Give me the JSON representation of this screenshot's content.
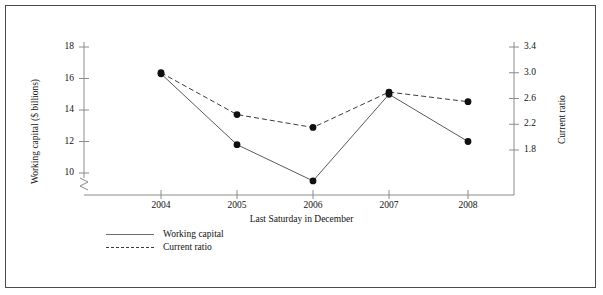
{
  "chart_data": {
    "type": "line",
    "title": "",
    "xlabel": "Last Saturday in December",
    "ylabel": "Working capital ($ billions)",
    "y2label": "Current ratio",
    "categories": [
      "2004",
      "2005",
      "2006",
      "2007",
      "2008"
    ],
    "x": [
      2004,
      2005,
      2006,
      2007,
      2008
    ],
    "ylim": [
      9.2,
      18
    ],
    "y2lim": [
      1.62,
      3.4
    ],
    "yticks": [
      "18",
      "16",
      "14",
      "12",
      "10"
    ],
    "ytick_values": [
      18,
      16,
      14,
      12,
      10
    ],
    "y2ticks": [
      "3.4",
      "3.0",
      "2.6",
      "2.2",
      "1.8"
    ],
    "y2tick_values": [
      3.4,
      3.0,
      2.6,
      2.2,
      1.8
    ],
    "xticks": [
      "2004",
      "2005",
      "2006",
      "2007",
      "2008"
    ],
    "axis_break": true,
    "grid": false,
    "legend_position": "below-left",
    "series": [
      {
        "name": "Working capital",
        "axis": "left",
        "style": "solid",
        "color": "#5a5a5a",
        "marker": "filled-circle",
        "values": [
          16.3,
          11.8,
          9.5,
          15.0,
          12.0
        ]
      },
      {
        "name": "Current ratio",
        "axis": "right",
        "style": "dashed",
        "color": "#3a3a3a",
        "marker": "filled-circle",
        "values": [
          3.0,
          2.35,
          2.15,
          2.7,
          2.55
        ]
      }
    ]
  },
  "legend": {
    "items": [
      {
        "label": "Working capital",
        "style": "solid"
      },
      {
        "label": "Current ratio",
        "style": "dashed"
      }
    ]
  },
  "colors": {
    "frame": "#4a4a4a",
    "axis": "#8c8c8c",
    "marker": "#101010",
    "solid_line": "#6b6b6b",
    "dashed_line": "#3a3a3a",
    "text": "#111111"
  }
}
